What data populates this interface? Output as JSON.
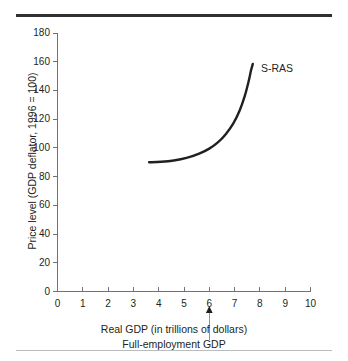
{
  "figure": {
    "background_color": "#ffffff",
    "rule_top_color": "#2e3033",
    "rule_bottom_color": "#b9bcbe"
  },
  "chart_data": {
    "type": "line",
    "title": "",
    "subtitle": "",
    "xlabel": "Real GDP (in trillions of dollars)",
    "ylabel": "Price level (GDP deflator, 1996 = 100)",
    "xlim": [
      0,
      10
    ],
    "ylim": [
      0,
      180
    ],
    "xticks": [
      0,
      1,
      2,
      3,
      4,
      5,
      6,
      7,
      8,
      9,
      10
    ],
    "yticks": [
      0,
      20,
      40,
      60,
      80,
      100,
      120,
      140,
      160,
      180
    ],
    "xtick_labels": [
      "0",
      "1",
      "2",
      "3",
      "4",
      "5",
      "6",
      "7",
      "8",
      "9",
      "10"
    ],
    "ytick_labels": [
      "0",
      "20",
      "40",
      "60",
      "80",
      "100",
      "120",
      "140",
      "160",
      "180"
    ],
    "grid": false,
    "legend": "none",
    "series": [
      {
        "name": "S-RAS",
        "label": "S-RAS",
        "color": "#231f20",
        "points": [
          {
            "x": 3.62,
            "y": 90.0
          },
          {
            "x": 4.1,
            "y": 90.3
          },
          {
            "x": 4.6,
            "y": 91.2
          },
          {
            "x": 5.1,
            "y": 93.0
          },
          {
            "x": 5.6,
            "y": 96.0
          },
          {
            "x": 6.0,
            "y": 99.5
          },
          {
            "x": 6.35,
            "y": 104.0
          },
          {
            "x": 6.65,
            "y": 109.5
          },
          {
            "x": 6.95,
            "y": 117.0
          },
          {
            "x": 7.2,
            "y": 126.0
          },
          {
            "x": 7.4,
            "y": 136.0
          },
          {
            "x": 7.55,
            "y": 146.0
          },
          {
            "x": 7.65,
            "y": 154.0
          },
          {
            "x": 7.72,
            "y": 158.5
          }
        ]
      }
    ],
    "annotations": [
      {
        "name": "full-employment-gdp-pointer",
        "x": 6,
        "arrow": "up",
        "caption": "Full-employment GDP"
      }
    ]
  },
  "labels": {
    "series_sras": "S-RAS",
    "axis_title_x": "Real GDP (in trillions of dollars)",
    "axis_title_y": "Price level (GDP deflator, 1996 = 100)",
    "pointer_caption": "Full-employment GDP"
  }
}
